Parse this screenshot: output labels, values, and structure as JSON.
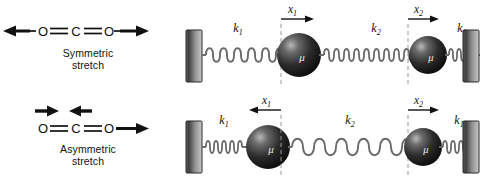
{
  "figure": {
    "background_color": "#ffffff",
    "panels": [
      {
        "id": "symmetric",
        "molecule": {
          "atoms": [
            "O",
            "C",
            "O"
          ],
          "bond": "double",
          "formula": "O=C=O",
          "arrows": [
            {
              "name": "left-arrow",
              "direction": "left",
              "position": "left-end"
            },
            {
              "name": "right-arrow",
              "direction": "right",
              "position": "right-end"
            }
          ]
        },
        "caption_line1": "Symmetric",
        "caption_line2": "stretch",
        "spring_model": {
          "wall_left": "fixed-wall",
          "wall_right": "fixed-wall",
          "springs": [
            {
              "label": "k",
              "sub": "1",
              "state": "stretched"
            },
            {
              "label": "k",
              "sub": "2",
              "state": "compressed"
            },
            {
              "label": "k",
              "sub": "1",
              "state": "compressed"
            }
          ],
          "masses": [
            {
              "label": "μ",
              "name": "mass-1"
            },
            {
              "label": "μ",
              "name": "mass-2"
            }
          ],
          "displacements": [
            {
              "label": "x",
              "sub": "1",
              "direction": "right"
            },
            {
              "label": "x",
              "sub": "2",
              "direction": "right"
            }
          ]
        }
      },
      {
        "id": "asymmetric",
        "molecule": {
          "atoms": [
            "O",
            "C",
            "O"
          ],
          "bond": "double",
          "formula": "O=C=O",
          "arrows": [
            {
              "name": "o-left-arrow",
              "direction": "right",
              "position": "above-left-oxygen"
            },
            {
              "name": "carbon-arrow",
              "direction": "left",
              "position": "above-carbon"
            },
            {
              "name": "right-arrow",
              "direction": "right",
              "position": "right-end"
            }
          ]
        },
        "caption_line1": "Asymmetric",
        "caption_line2": "stretch",
        "spring_model": {
          "wall_left": "fixed-wall",
          "wall_right": "fixed-wall",
          "springs": [
            {
              "label": "k",
              "sub": "1",
              "state": "compressed"
            },
            {
              "label": "k",
              "sub": "2",
              "state": "stretched"
            },
            {
              "label": "k",
              "sub": "1",
              "state": "compressed"
            }
          ],
          "masses": [
            {
              "label": "μ",
              "name": "mass-1"
            },
            {
              "label": "μ",
              "name": "mass-2"
            }
          ],
          "displacements": [
            {
              "label": "x",
              "sub": "1",
              "direction": "left"
            },
            {
              "label": "x",
              "sub": "2",
              "direction": "right"
            }
          ]
        }
      }
    ],
    "colors": {
      "stroke": "#1a1a1a",
      "wall_dark": "#4d4d4d",
      "wall_light": "#b8b8b8",
      "mass_dark": "#141414",
      "mass_light": "#9a9a9a",
      "spring": "#6e6e6e",
      "dashed": "#8a8a8a"
    }
  }
}
